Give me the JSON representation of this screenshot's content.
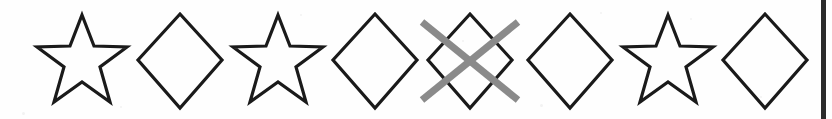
{
  "page": {
    "background_color": "#fefefe",
    "width": 832,
    "height": 119
  },
  "style": {
    "outline_color": "#1a1a1a",
    "outline_width": 3.2,
    "cross_out_color": "#8a8a8a",
    "cross_out_width": 7,
    "page_edge_color": "#2b2b2b"
  },
  "sequence": {
    "count": 8,
    "pattern_label": "star, diamond, star, diamond, diamond, diamond, star, diamond",
    "shapes": [
      {
        "index": 1,
        "type": "star",
        "label": "star",
        "x": 32,
        "crossed_out": false
      },
      {
        "index": 2,
        "type": "diamond",
        "label": "diamond",
        "x": 130,
        "crossed_out": false
      },
      {
        "index": 3,
        "type": "star",
        "label": "star",
        "x": 228,
        "crossed_out": false
      },
      {
        "index": 4,
        "type": "diamond",
        "label": "diamond",
        "x": 325,
        "crossed_out": false
      },
      {
        "index": 5,
        "type": "diamond",
        "label": "diamond",
        "x": 420,
        "crossed_out": true
      },
      {
        "index": 6,
        "type": "diamond",
        "label": "diamond",
        "x": 520,
        "crossed_out": false
      },
      {
        "index": 7,
        "type": "star",
        "label": "star",
        "x": 618,
        "crossed_out": false
      },
      {
        "index": 8,
        "type": "diamond",
        "label": "diamond",
        "x": 715,
        "crossed_out": false
      }
    ]
  },
  "geometry": {
    "star_points": "50,5 62,36 95,37 68,57 78,92 50,72 22,92 32,57 5,37 38,36",
    "diamond_points": "50,4 92,50 50,98 8,50",
    "cross_stroke_1": "2,12 98,90",
    "cross_stroke_2": "98,12 2,90"
  },
  "page_edge": {
    "present": true,
    "x": 821,
    "width": 5
  },
  "speckles": [
    {
      "x": 22,
      "y": 112,
      "size": 3
    },
    {
      "x": 300,
      "y": 14,
      "size": 2
    },
    {
      "x": 462,
      "y": 40,
      "size": 2
    },
    {
      "x": 540,
      "y": 104,
      "size": 3
    },
    {
      "x": 690,
      "y": 18,
      "size": 2
    },
    {
      "x": 760,
      "y": 96,
      "size": 2
    },
    {
      "x": 120,
      "y": 106,
      "size": 2
    },
    {
      "x": 600,
      "y": 12,
      "size": 2
    }
  ]
}
